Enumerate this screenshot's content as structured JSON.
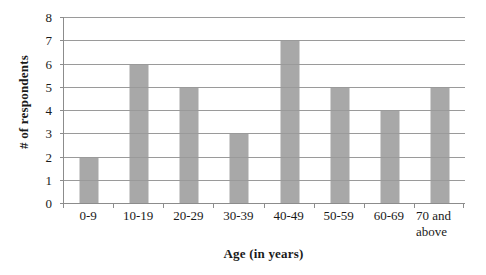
{
  "chart_data": {
    "type": "bar",
    "title": "",
    "xlabel": "Age (in years)",
    "ylabel": "# of respondents",
    "categories": [
      "0-9",
      "10-19",
      "20-29",
      "30-39",
      "40-49",
      "50-59",
      "60-69",
      "70 and above"
    ],
    "category_labels_rendered": [
      "0-9",
      "10-19",
      "20-29",
      "30-39",
      "40-49",
      "50-59",
      "60-69",
      "70 and\nabove"
    ],
    "values": [
      2,
      6,
      5,
      3,
      7,
      5,
      4,
      5
    ],
    "ylim": [
      0,
      8
    ],
    "ytick_labels": [
      "0",
      "1",
      "2",
      "3",
      "4",
      "5",
      "6",
      "7",
      "8"
    ],
    "ytick_values": [
      0,
      1,
      2,
      3,
      4,
      5,
      6,
      7,
      8
    ],
    "grid": "horizontal",
    "legend": "none",
    "bar_color": "#a8a8a8",
    "axis_color": "#8c8c8c",
    "gridline_color": "#9a9a9a",
    "background_color": "#ffffff"
  }
}
